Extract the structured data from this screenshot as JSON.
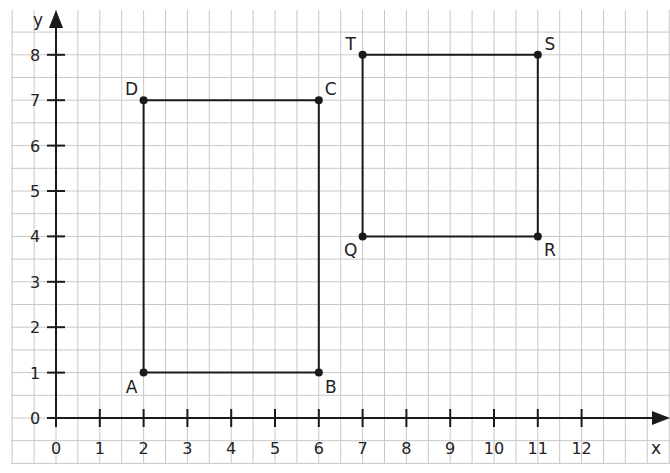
{
  "diagram": {
    "type": "coordinate-grid",
    "axes": {
      "x_label": "x",
      "y_label": "y",
      "x_ticks": [
        "0",
        "1",
        "2",
        "3",
        "4",
        "5",
        "6",
        "7",
        "8",
        "9",
        "10",
        "11",
        "12"
      ],
      "y_ticks": [
        "0",
        "1",
        "2",
        "3",
        "4",
        "5",
        "6",
        "7",
        "8"
      ]
    },
    "shapes": [
      {
        "name": "ABCD",
        "points": [
          {
            "label": "A",
            "x": 2,
            "y": 1
          },
          {
            "label": "B",
            "x": 6,
            "y": 1
          },
          {
            "label": "C",
            "x": 6,
            "y": 7
          },
          {
            "label": "D",
            "x": 2,
            "y": 7
          }
        ]
      },
      {
        "name": "QRST",
        "points": [
          {
            "label": "Q",
            "x": 7,
            "y": 4
          },
          {
            "label": "R",
            "x": 11,
            "y": 4
          },
          {
            "label": "S",
            "x": 11,
            "y": 8
          },
          {
            "label": "T",
            "x": 7,
            "y": 8
          }
        ]
      }
    ],
    "colors": {
      "grid": "#c8c8c8",
      "axis": "#1a1a1a",
      "shape": "#1a1a1a",
      "background": "#ffffff"
    }
  }
}
